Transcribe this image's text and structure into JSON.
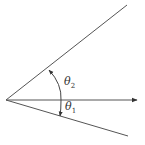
{
  "diagram": {
    "type": "angle-diagram",
    "colors": {
      "line": "#555555",
      "text": "#333333",
      "background": "#ffffff"
    },
    "origin": [
      6,
      100
    ],
    "rays": [
      {
        "name": "upper-ray",
        "end": [
          127,
          5
        ]
      },
      {
        "name": "reference-axis-arrow",
        "end": [
          137,
          100
        ],
        "arrow": true
      },
      {
        "name": "lower-ray",
        "end": [
          128,
          136
        ]
      }
    ],
    "arc": {
      "x": 61,
      "y_top": 69,
      "y_bottom": 116
    },
    "labels": {
      "theta2": {
        "symbol": "θ",
        "subscript": "2"
      },
      "theta1": {
        "symbol": "θ",
        "subscript": "1"
      }
    }
  }
}
